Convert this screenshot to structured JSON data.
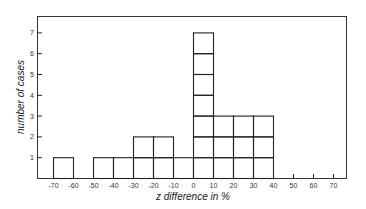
{
  "chart_data": {
    "type": "bar",
    "subtype": "histogram",
    "title": "",
    "xlabel": "z difference in %",
    "ylabel": "number of cases",
    "x_ticks": [
      -70,
      -60,
      -50,
      -40,
      -30,
      -20,
      -10,
      0,
      10,
      20,
      30,
      40,
      50,
      60,
      70
    ],
    "y_ticks": [
      1,
      2,
      3,
      4,
      5,
      6,
      7
    ],
    "xlim": [
      -78,
      78
    ],
    "ylim": [
      0,
      7.8
    ],
    "bins": [
      {
        "from": -70,
        "to": -60,
        "count": 1
      },
      {
        "from": -60,
        "to": -50,
        "count": 0
      },
      {
        "from": -50,
        "to": -40,
        "count": 1
      },
      {
        "from": -40,
        "to": -30,
        "count": 1
      },
      {
        "from": -30,
        "to": -20,
        "count": 2
      },
      {
        "from": -20,
        "to": -10,
        "count": 2
      },
      {
        "from": -10,
        "to": 0,
        "count": 1
      },
      {
        "from": 0,
        "to": 10,
        "count": 7
      },
      {
        "from": 10,
        "to": 20,
        "count": 3
      },
      {
        "from": 20,
        "to": 30,
        "count": 3
      },
      {
        "from": 30,
        "to": 40,
        "count": 3
      }
    ],
    "categories": [
      "-70 to -60",
      "-60 to -50",
      "-50 to -40",
      "-40 to -30",
      "-30 to -20",
      "-20 to -10",
      "-10 to 0",
      "0 to 10",
      "10 to 20",
      "20 to 30",
      "30 to 40"
    ],
    "values": [
      1,
      0,
      1,
      1,
      2,
      2,
      1,
      7,
      3,
      3,
      3
    ],
    "style": "stacked unit boxes, black outline, no fill",
    "grid": false,
    "legend": null
  },
  "colors": {
    "line": "#222222",
    "background": "#ffffff"
  }
}
